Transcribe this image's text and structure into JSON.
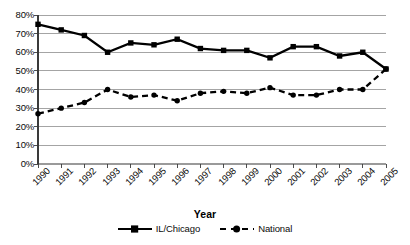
{
  "chart_data": {
    "type": "line",
    "title": "",
    "xlabel": "Year",
    "ylabel": "",
    "grid": "horizontal",
    "legend_position": "bottom",
    "xlim": [
      1990,
      2005
    ],
    "ylim": [
      0,
      80
    ],
    "y_tick_step": 10,
    "categories": [
      "1990",
      "1991",
      "1992",
      "1993",
      "1994",
      "1995",
      "1996",
      "1997",
      "1998",
      "1999",
      "2000",
      "2001",
      "2002",
      "2003",
      "2004",
      "2005"
    ],
    "y_tick_labels": [
      "80%",
      "70%",
      "60%",
      "50%",
      "40%",
      "30%",
      "20%",
      "10%",
      "0%"
    ],
    "y_tick_values": [
      80,
      70,
      60,
      50,
      40,
      30,
      20,
      10,
      0
    ],
    "series": [
      {
        "name": "IL/Chicago",
        "marker": "square",
        "dash": "solid",
        "color": "#000000",
        "values": [
          75,
          72,
          69,
          60,
          65,
          64,
          67,
          62,
          61,
          61,
          57,
          63,
          63,
          58,
          60,
          51
        ]
      },
      {
        "name": "National",
        "marker": "circle",
        "dash": "dashed",
        "color": "#000000",
        "values": [
          27,
          30,
          33,
          40,
          36,
          37,
          34,
          38,
          39,
          38,
          41,
          37,
          37,
          40,
          40,
          51
        ]
      }
    ]
  },
  "axis": {
    "x_title": "Year"
  },
  "legend": {
    "entries": [
      {
        "label": "IL/Chicago"
      },
      {
        "label": "National"
      }
    ]
  }
}
